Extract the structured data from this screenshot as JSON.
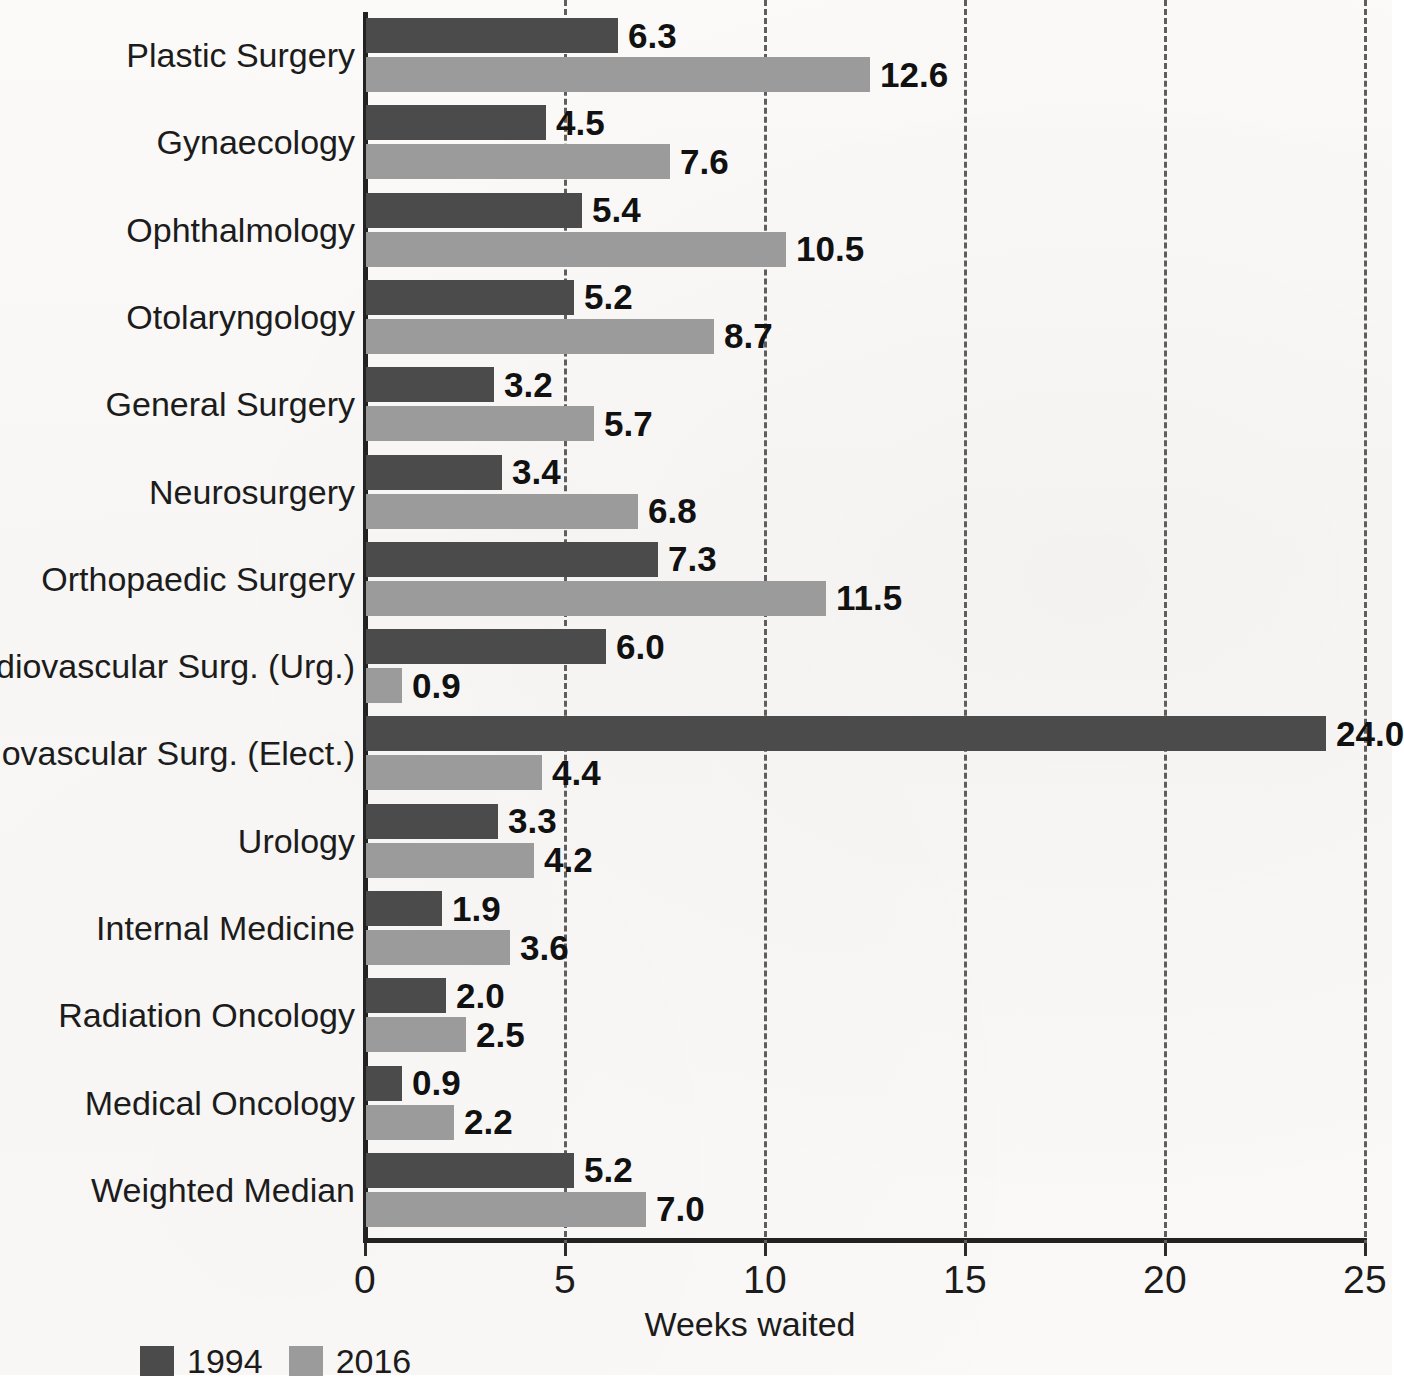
{
  "chart_data": {
    "type": "bar",
    "orientation": "horizontal",
    "title": "",
    "xlabel": "Weeks waited",
    "ylabel": "",
    "xlim": [
      0,
      25
    ],
    "xticks": [
      0,
      5,
      10,
      15,
      20,
      25
    ],
    "xtick_labels": [
      "0",
      "5",
      "10",
      "15",
      "20",
      "25"
    ],
    "grid": "vertical dashed gridlines at each x tick",
    "legend_position": "bottom-left",
    "categories": [
      "Plastic Surgery",
      "Gynaecology",
      "Ophthalmology",
      "Otolaryngology",
      "General Surgery",
      "Neurosurgery",
      "Orthopaedic Surgery",
      "Cardiovascular Surg. (Urg.)",
      "Cardiovascular Surg. (Elect.)",
      "Urology",
      "Internal Medicine",
      "Radiation Oncology",
      "Medical Oncology",
      "Weighted Median"
    ],
    "series": [
      {
        "name": "1994",
        "color": "#4b4b4b",
        "values": [
          6.3,
          4.5,
          5.4,
          5.2,
          3.2,
          3.4,
          7.3,
          6.0,
          24.0,
          3.3,
          1.9,
          2.0,
          0.9,
          5.2
        ],
        "labels": [
          "6.3",
          "4.5",
          "5.4",
          "5.2",
          "3.2",
          "3.4",
          "7.3",
          "6.0",
          "24.0",
          "3.3",
          "1.9",
          "2.0",
          "0.9",
          "5.2"
        ]
      },
      {
        "name": "2016",
        "color": "#9b9b9b",
        "values": [
          12.6,
          7.6,
          10.5,
          8.7,
          5.7,
          6.8,
          11.5,
          0.9,
          4.4,
          4.2,
          3.6,
          2.5,
          2.2,
          7.0
        ],
        "labels": [
          "12.6",
          "7.6",
          "10.5",
          "8.7",
          "5.7",
          "6.8",
          "11.5",
          "0.9",
          "4.4",
          "4.2",
          "3.6",
          "2.5",
          "2.2",
          "7.0"
        ]
      }
    ]
  },
  "legend": {
    "items": [
      {
        "label": "1994",
        "color": "#4b4b4b"
      },
      {
        "label": "2016",
        "color": "#9b9b9b"
      }
    ]
  },
  "axis": {
    "x_title": "Weeks waited"
  }
}
